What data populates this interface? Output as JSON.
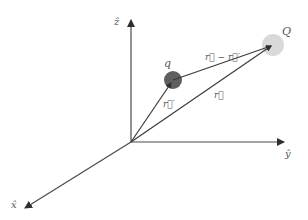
{
  "diagram": {
    "colors": {
      "axis": "#4a4a4a",
      "vector": "#3a3a3a",
      "label": "#555555",
      "charge_q": "#5f5f5f",
      "charge_Q": "#d9d9d9"
    },
    "axes": {
      "z_label": "ẑ",
      "y_label": "ŷ",
      "x_label": "x̂"
    },
    "charges": {
      "q_label": "q",
      "Q_label": "Q"
    },
    "vectors": {
      "r_prime_label": "r⃗′",
      "r_label": "r⃗",
      "r_minus_r_prime_label": "r⃗ − r⃗′"
    }
  }
}
